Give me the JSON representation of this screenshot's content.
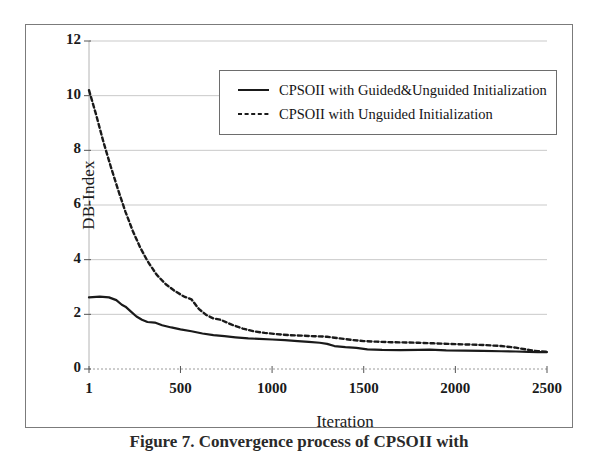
{
  "figure": {
    "caption": "Figure 7. Convergence process of CPSOII with"
  },
  "legend": {
    "position": "top-center-inside",
    "items": [
      {
        "label": "CPSOII with Guided&Unguided Initialization",
        "style": "solid",
        "color": "#1a1a1a",
        "icon": "solid-line-swatch"
      },
      {
        "label": "CPSOII with Unguided Initialization",
        "style": "dashed",
        "color": "#1a1a1a",
        "icon": "dashed-line-swatch"
      }
    ]
  },
  "axes": {
    "y_title": "DB-Index",
    "x_title": "Iteration",
    "y_ticks": [
      "0",
      "2",
      "4",
      "6",
      "8",
      "10",
      "12"
    ],
    "x_ticks": [
      "1",
      "500",
      "1000",
      "1500",
      "2000",
      "2500"
    ]
  },
  "chart_data": {
    "type": "line",
    "title": "",
    "xlabel": "Iteration",
    "ylabel": "DB-Index",
    "xlim": [
      1,
      2500
    ],
    "ylim": [
      0,
      12
    ],
    "y_ticks": [
      0,
      2,
      4,
      6,
      8,
      10,
      12
    ],
    "x_ticks": [
      1,
      500,
      1000,
      1500,
      2000,
      2500
    ],
    "grid": "horizontal",
    "legend_position": "upper center (inside plot)",
    "series": [
      {
        "name": "CPSOII with Guided&Unguided Initialization",
        "style": "solid",
        "color": "#1a1a1a",
        "x": [
          1,
          60,
          110,
          150,
          180,
          200,
          230,
          260,
          290,
          320,
          360,
          400,
          450,
          500,
          560,
          620,
          680,
          740,
          800,
          870,
          930,
          1000,
          1070,
          1140,
          1200,
          1260,
          1300,
          1340,
          1400,
          1460,
          1520,
          1600,
          1700,
          1800,
          1860,
          1950,
          2050,
          2150,
          2250,
          2330,
          2400,
          2450,
          2500
        ],
        "y": [
          2.62,
          2.65,
          2.62,
          2.52,
          2.35,
          2.28,
          2.1,
          1.92,
          1.8,
          1.72,
          1.7,
          1.6,
          1.52,
          1.45,
          1.38,
          1.3,
          1.24,
          1.2,
          1.16,
          1.12,
          1.1,
          1.08,
          1.06,
          1.02,
          0.99,
          0.96,
          0.92,
          0.84,
          0.8,
          0.77,
          0.72,
          0.7,
          0.69,
          0.7,
          0.71,
          0.68,
          0.67,
          0.66,
          0.65,
          0.64,
          0.63,
          0.62,
          0.62
        ]
      },
      {
        "name": "CPSOII with Unguided Initialization",
        "style": "dashed",
        "color": "#1a1a1a",
        "x": [
          1,
          40,
          80,
          120,
          160,
          200,
          240,
          280,
          320,
          370,
          420,
          470,
          520,
          560,
          600,
          640,
          680,
          720,
          780,
          840,
          900,
          960,
          1020,
          1090,
          1160,
          1230,
          1300,
          1370,
          1440,
          1500,
          1570,
          1650,
          1730,
          1800,
          1880,
          1960,
          2050,
          2150,
          2250,
          2330,
          2400,
          2450,
          2500
        ],
        "y": [
          10.2,
          9.3,
          8.3,
          7.4,
          6.55,
          5.75,
          5.05,
          4.45,
          3.95,
          3.45,
          3.1,
          2.85,
          2.65,
          2.55,
          2.2,
          1.98,
          1.85,
          1.8,
          1.62,
          1.48,
          1.38,
          1.32,
          1.28,
          1.24,
          1.22,
          1.2,
          1.18,
          1.12,
          1.06,
          1.02,
          1.0,
          0.98,
          0.97,
          0.96,
          0.94,
          0.92,
          0.9,
          0.88,
          0.84,
          0.78,
          0.7,
          0.65,
          0.63
        ]
      }
    ]
  }
}
